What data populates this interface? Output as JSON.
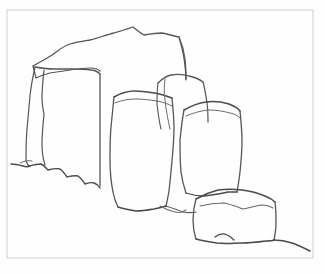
{
  "artwork": {
    "title": "Pencil line drawing of standing stone blocks",
    "medium": "graphite line drawing",
    "subject": "group of rectangular stone blocks / megaliths on a ground line",
    "background_color": "#fefefe",
    "line_color": "#4a4a4f",
    "frame_color": "#cfcfcf",
    "canvas": {
      "width": 325,
      "height": 274
    }
  },
  "frame": {
    "name": "rectangular border",
    "x": 7,
    "y": 10,
    "width": 306,
    "height": 248,
    "stroke_width": 1
  },
  "shapes": [
    {
      "id": "back-slab",
      "label": "large back slab",
      "stroke": "#55555a",
      "stroke_width": 1.3,
      "path": "M 33 66 C 40 62 46 59 52 55 C 58 51 63 46 70 44 C 77 42 84 41 90 40 C 98 38 106 35 114 33 C 121 31 127 29 133 27 C 137 30 140 33 144 35 C 150 34 156 33 162 33 C 168 34 173 36 179 37 C 181 44 183 51 184 58 C 185 65 186 72 186 79"
    },
    {
      "id": "back-slab-left-shoulder",
      "label": "back slab left shoulder fold",
      "stroke": "#55555a",
      "stroke_width": 1.2,
      "path": "M 33 66 C 34 70 35 74 36 78 C 40 76 45 74 50 73 C 57 72 64 71 70 70 C 77 69 84 68 90 68 C 95 68 98 69 100 71"
    },
    {
      "id": "back-slab-right-face",
      "label": "back slab right face edge",
      "stroke": "#55555a",
      "stroke_width": 1.2,
      "path": "M 179 37 C 182 44 184 51 185 59 C 186 67 186 74 186 80"
    },
    {
      "id": "left-block-side",
      "label": "left block narrow side face",
      "stroke": "#55555a",
      "stroke_width": 1.2,
      "path": "M 35 67 C 33 76 31 86 30 96 C 29 107 28 118 27 129 C 26 140 26 150 26 161 C 27 163 28 165 29 166"
    },
    {
      "id": "left-block-top",
      "label": "left block top edge",
      "stroke": "#55555a",
      "stroke_width": 1.4,
      "path": "M 35 67 C 41 68 47 69 53 69 C 60 69 66 69 72 69 C 79 69 85 69 91 70 C 95 70 98 72 100 74"
    },
    {
      "id": "left-block-front-left",
      "label": "left block front left edge",
      "stroke": "#55555a",
      "stroke_width": 1.2,
      "path": "M 44 70 C 43 79 42 89 42 98 C 42 104 43 109 44 114 C 43 124 42 134 42 144 C 42 152 43 159 45 165"
    },
    {
      "id": "left-block-front-right",
      "label": "left block front right edge",
      "stroke": "#55555a",
      "stroke_width": 1.3,
      "path": "M 100 74 C 100 86 100 98 100 110 C 100 124 100 138 100 152 C 100 164 100 176 100 186"
    },
    {
      "id": "left-block-bottom",
      "label": "left block ragged bottom edge",
      "stroke": "#4a4a4f",
      "stroke_width": 1.4,
      "path": "M 29 166 C 33 165 37 164 41 164 C 44 165 46 168 48 170 C 52 169 56 168 60 169 C 63 171 65 174 67 177 C 71 176 74 175 78 176 C 81 178 83 181 85 184 C 88 183 91 182 94 183 C 97 184 99 186 100 188"
    },
    {
      "id": "middle-block-top",
      "label": "middle block top edge",
      "stroke": "#4a4a4f",
      "stroke_width": 1.5,
      "path": "M 114 97 C 121 93 128 91 135 91 C 142 91 148 92 155 93 C 161 94 167 96 172 98"
    },
    {
      "id": "middle-block-top-inner",
      "label": "middle block top inner edge",
      "stroke": "#6a6a70",
      "stroke_width": 1.0,
      "path": "M 115 103 C 122 100 129 99 136 99 C 143 99 150 100 157 101 C 163 102 168 104 172 106"
    },
    {
      "id": "middle-block-left",
      "label": "middle block left edge",
      "stroke": "#55555a",
      "stroke_width": 1.3,
      "path": "M 114 97 C 113 107 112 117 111 127 C 110 138 110 149 110 160 C 110 171 111 182 113 192 C 114 198 116 203 118 207"
    },
    {
      "id": "middle-block-right",
      "label": "middle block right edge",
      "stroke": "#55555a",
      "stroke_width": 1.3,
      "path": "M 172 98 C 173 108 174 118 174 128 C 174 139 173 150 172 161 C 171 172 170 182 169 191 C 168 197 167 202 166 206"
    },
    {
      "id": "middle-block-bottom",
      "label": "middle block bottom edge",
      "stroke": "#4a4a4f",
      "stroke_width": 1.5,
      "path": "M 118 207 C 124 209 130 210 136 211 C 142 211 148 210 154 209 C 159 208 163 207 166 206"
    },
    {
      "id": "rear-right-block-top",
      "label": "rear right block top edge",
      "stroke": "#55555a",
      "stroke_width": 1.3,
      "path": "M 158 83 C 162 79 166 76 171 75 C 177 74 183 74 189 76 C 194 77 199 79 203 82"
    },
    {
      "id": "rear-right-block-left",
      "label": "rear right block left edge",
      "stroke": "#55555a",
      "stroke_width": 1.1,
      "path": "M 158 83 C 157 90 157 97 157 104 C 158 113 159 121 161 129"
    },
    {
      "id": "rear-right-block-inner",
      "label": "rear right block inner fold",
      "stroke": "#6a6a70",
      "stroke_width": 1.0,
      "path": "M 165 79 C 164 86 164 93 165 100 C 166 110 168 120 170 129"
    },
    {
      "id": "rear-right-block-right",
      "label": "rear right block right edge",
      "stroke": "#55555a",
      "stroke_width": 1.2,
      "path": "M 203 82 C 205 89 206 96 207 103 C 208 110 208 116 208 122"
    },
    {
      "id": "right-block-top",
      "label": "right block top edge",
      "stroke": "#4a4a4f",
      "stroke_width": 1.5,
      "path": "M 184 110 C 191 106 198 103 206 102 C 214 101 222 102 229 104 C 234 106 238 108 240 111"
    },
    {
      "id": "right-block-top-inner",
      "label": "right block top inner edge",
      "stroke": "#6a6a70",
      "stroke_width": 1.0,
      "path": "M 186 116 C 193 113 200 111 208 110 C 216 110 223 111 230 113 C 235 114 238 116 240 118"
    },
    {
      "id": "right-block-left",
      "label": "right block left edge",
      "stroke": "#55555a",
      "stroke_width": 1.3,
      "path": "M 184 110 C 182 120 181 130 180 140 C 180 151 180 162 181 172 C 182 180 184 187 186 193"
    },
    {
      "id": "right-block-right",
      "label": "right block right edge",
      "stroke": "#55555a",
      "stroke_width": 1.3,
      "path": "M 240 111 C 241 121 242 131 242 141 C 242 152 241 162 240 172 C 239 180 238 187 237 192"
    },
    {
      "id": "right-block-bottom",
      "label": "right block bottom edge",
      "stroke": "#4a4a4f",
      "stroke_width": 1.3,
      "path": "M 186 193 C 192 195 198 196 204 196 C 212 195 220 194 228 192 C 232 192 235 192 237 192"
    },
    {
      "id": "front-block-top",
      "label": "foreground block top face edge",
      "stroke": "#4a4a4f",
      "stroke_width": 1.5,
      "path": "M 196 199 C 203 195 210 192 218 190 C 226 189 234 189 242 190 C 250 191 258 193 265 196 C 270 198 273 200 275 202"
    },
    {
      "id": "front-block-top-inner",
      "label": "foreground block top inner ridge",
      "stroke": "#6a6a70",
      "stroke_width": 1.1,
      "path": "M 200 206 C 208 204 216 203 224 203 C 231 204 237 207 243 209 C 249 208 255 206 261 205 C 266 205 270 206 273 208"
    },
    {
      "id": "front-block-left",
      "label": "foreground block left edge",
      "stroke": "#55555a",
      "stroke_width": 1.3,
      "path": "M 196 199 C 194 206 193 213 193 220 C 193 227 194 233 196 239"
    },
    {
      "id": "front-block-right",
      "label": "foreground block right edge",
      "stroke": "#55555a",
      "stroke_width": 1.3,
      "path": "M 275 202 C 276 209 276 216 276 223 C 276 229 275 235 274 240"
    },
    {
      "id": "front-block-bottom",
      "label": "foreground block bottom edge",
      "stroke": "#4a4a4f",
      "stroke_width": 1.5,
      "path": "M 196 239 C 203 241 210 242 217 243 C 226 244 234 243 242 243 C 250 243 258 242 266 241 C 270 241 272 241 274 240"
    },
    {
      "id": "ground-line-left",
      "label": "ground line left of blocks",
      "stroke": "#4a4a4f",
      "stroke_width": 1.4,
      "path": "M 11 164 C 15 164 19 165 23 166 C 26 167 28 167 30 166"
    },
    {
      "id": "ground-line-front",
      "label": "ground line in front of middle block",
      "stroke": "#55555a",
      "stroke_width": 1.2,
      "path": "M 166 206 C 172 208 178 210 183 212 C 188 213 192 213 196 212"
    },
    {
      "id": "ground-line-right",
      "label": "ground line right of foreground block",
      "stroke": "#4a4a4f",
      "stroke_width": 1.5,
      "path": "M 274 240 C 280 240 286 241 292 243 C 298 245 304 248 310 251"
    },
    {
      "id": "ground-notch-front",
      "label": "ground notch under foreground block",
      "stroke": "#4a4a4f",
      "stroke_width": 1.3,
      "path": "M 215 237 C 219 234 223 233 227 235 C 230 236 232 238 234 240"
    },
    {
      "id": "shadow-stroke-left",
      "label": "shadow stroke at left block base",
      "stroke": "#6a6a70",
      "stroke_width": 1.0,
      "path": "M 20 163 C 24 161 28 160 32 161"
    },
    {
      "id": "middle-ground-dip",
      "label": "ground dip between middle and right block",
      "stroke": "#6a6a70",
      "stroke_width": 1.1,
      "path": "M 160 206 C 165 209 170 211 175 212 C 179 213 183 212 186 210"
    }
  ],
  "caption": {
    "visible": false,
    "text": ""
  }
}
